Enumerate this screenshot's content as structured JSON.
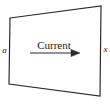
{
  "diagram": {
    "shape": {
      "name": "conductor-slab",
      "type": "quadrilateral",
      "stroke_color": "#2b2b2b",
      "fill_color": "#ffffff",
      "stroke_width": 1.2,
      "vertices": [
        {
          "name": "top-left",
          "x": 10,
          "y": 18
        },
        {
          "name": "top-right",
          "x": 101,
          "y": 6
        },
        {
          "name": "bottom-right",
          "x": 100,
          "y": 96
        },
        {
          "name": "bottom-left",
          "x": 9,
          "y": 84
        }
      ]
    },
    "labels": {
      "left": "a",
      "right": "x",
      "current": "Current"
    },
    "arrow": {
      "name": "current-direction-arrow",
      "direction": "right",
      "color": "#2b2b2b",
      "start_x": 30,
      "end_x": 80,
      "y": 53
    }
  }
}
